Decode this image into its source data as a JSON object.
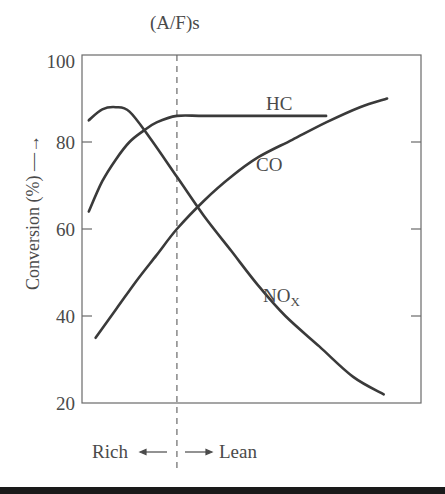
{
  "chart_data": {
    "type": "line",
    "title": "",
    "top_annotation": "(A/F)s",
    "xlabel": "",
    "ylabel": "Conversion (%)",
    "ylim": [
      20,
      100
    ],
    "yticks": [
      20,
      40,
      60,
      80,
      100
    ],
    "grid": false,
    "legend": "inline labels",
    "stoichiometric_line_x": 0.28,
    "x_annotations": {
      "left": "Rich",
      "right": "Lean"
    },
    "x_range_note": "air/fuel ratio increasing left to right (relative 0–1)",
    "series": [
      {
        "name": "HC",
        "label": "HC",
        "x": [
          0.02,
          0.06,
          0.1,
          0.14,
          0.18,
          0.22,
          0.28,
          0.36,
          0.5,
          0.65,
          0.72
        ],
        "values": [
          64,
          71,
          76,
          80,
          82.5,
          84.5,
          86,
          86,
          86,
          86,
          86
        ]
      },
      {
        "name": "CO",
        "label": "CO",
        "x": [
          0.04,
          0.1,
          0.16,
          0.22,
          0.28,
          0.36,
          0.44,
          0.52,
          0.62,
          0.72,
          0.82,
          0.9
        ],
        "values": [
          35,
          41.5,
          48,
          54,
          60,
          66.5,
          72,
          76.5,
          80.5,
          84.5,
          88,
          90
        ]
      },
      {
        "name": "NOx",
        "label": "NOx",
        "x": [
          0.02,
          0.06,
          0.1,
          0.14,
          0.2,
          0.28,
          0.36,
          0.44,
          0.52,
          0.6,
          0.7,
          0.8,
          0.89
        ],
        "values": [
          85,
          87.5,
          88,
          87,
          81,
          72,
          63,
          55,
          47,
          40,
          33,
          26,
          22
        ]
      }
    ]
  },
  "labels": {
    "top": "(A/F)s",
    "y_axis": "Conversion (%) —→",
    "ytick_100": "100",
    "ytick_80": "80",
    "ytick_60": "60",
    "ytick_40": "40",
    "ytick_20": "20",
    "hc": "HC",
    "co": "CO",
    "nox_main": "NO",
    "nox_sub": "X",
    "rich": "Rich",
    "lean": "Lean"
  }
}
